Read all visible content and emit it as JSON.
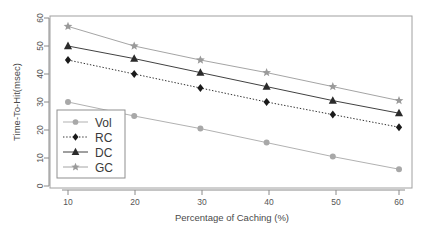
{
  "chart_data": {
    "type": "line",
    "title": "",
    "xlabel": "Percentage of Caching (%)",
    "ylabel": "Time-To-Hit(msec)",
    "x": [
      10,
      20,
      30,
      40,
      50,
      60
    ],
    "xticks": [
      "10",
      "20",
      "30",
      "40",
      "50",
      "60"
    ],
    "yticks": [
      "0",
      "10",
      "20",
      "30",
      "40",
      "50",
      "60"
    ],
    "xlim": [
      5,
      63
    ],
    "ylim": [
      0,
      62
    ],
    "grid": false,
    "legend_position": "bottom-left",
    "series": [
      {
        "name": "Vol",
        "values": [
          30.0,
          25.0,
          20.5,
          15.5,
          10.5,
          6.0
        ],
        "marker": "circle",
        "color": "#a8a8a8",
        "line_style": "solid"
      },
      {
        "name": "RC",
        "values": [
          45.0,
          40.0,
          35.0,
          30.0,
          25.5,
          21.0
        ],
        "marker": "diamond",
        "color": "#1a1a1a",
        "line_style": "dotted"
      },
      {
        "name": "DC",
        "values": [
          50.0,
          45.5,
          40.5,
          35.5,
          30.5,
          26.0
        ],
        "marker": "triangle",
        "color": "#2b2b2b",
        "line_style": "solid"
      },
      {
        "name": "GC",
        "values": [
          57.0,
          50.0,
          45.0,
          40.5,
          35.5,
          30.5
        ],
        "marker": "star",
        "color": "#9a9a9a",
        "line_style": "solid"
      }
    ]
  },
  "legend": {
    "entries": [
      "Vol",
      "RC",
      "DC",
      "GC"
    ]
  },
  "colors": {
    "axis": "#8a8a8a",
    "frame": "#9d9d9d",
    "text": "#4a4a4a",
    "background": "#ffffff"
  }
}
